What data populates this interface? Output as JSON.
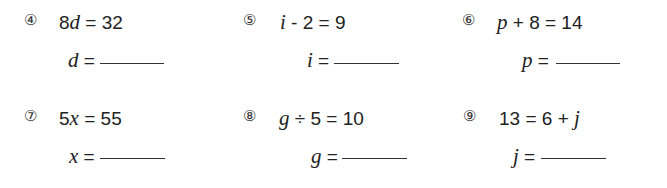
{
  "problems": [
    {
      "number": "④",
      "var": "d",
      "eq_pre": "8",
      "eq_var": "d",
      "eq_post": " = 32",
      "answer_var": "d",
      "answer_eq": " ="
    },
    {
      "number": "⑤",
      "var": "i",
      "eq_pre": "",
      "eq_var": "i",
      "eq_post": " - 2 = 9",
      "answer_var": "i",
      "answer_eq": " ="
    },
    {
      "number": "⑥",
      "var": "p",
      "eq_pre": "",
      "eq_var": "p",
      "eq_post": " + 8 = 14",
      "answer_var": "p",
      "answer_eq": " ="
    },
    {
      "number": "⑦",
      "var": "x",
      "eq_pre": "5",
      "eq_var": "x",
      "eq_post": " = 55",
      "answer_var": "x",
      "answer_eq": " ="
    },
    {
      "number": "⑧",
      "var": "g",
      "eq_pre": "",
      "eq_var": "g",
      "eq_post": " ÷ 5 = 10",
      "answer_var": "g",
      "answer_eq": " ="
    },
    {
      "number": "⑨",
      "var": "j",
      "eq_pre": "13 = 6 + ",
      "eq_var": "j",
      "eq_post": "",
      "answer_var": "j",
      "answer_eq": " ="
    }
  ]
}
